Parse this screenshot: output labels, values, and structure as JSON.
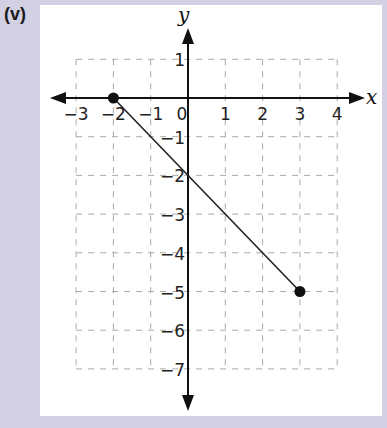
{
  "panel_label": "(v)",
  "chart_data": {
    "type": "line",
    "title": "",
    "xlabel": "x",
    "ylabel": "y",
    "xlim": [
      -3,
      4
    ],
    "ylim": [
      -7,
      1
    ],
    "grid": true,
    "grid_style": "dashed",
    "x_ticks": [
      "-3",
      "-2",
      "-1",
      "0",
      "1",
      "2",
      "3",
      "4"
    ],
    "y_ticks": [
      "1",
      "-1",
      "-2",
      "-3",
      "-4",
      "-5",
      "-6",
      "-7"
    ],
    "series": [
      {
        "name": "segment",
        "x": [
          -2,
          3
        ],
        "y": [
          0,
          -5
        ],
        "endpoints": "closed-dots"
      }
    ],
    "annotations": [
      "line crosses y-axis at (0, -2)"
    ]
  },
  "colors": {
    "background": "#d3d0e4",
    "panel": "#ffffff",
    "axis": "#111111",
    "grid": "#aaaaaa"
  }
}
